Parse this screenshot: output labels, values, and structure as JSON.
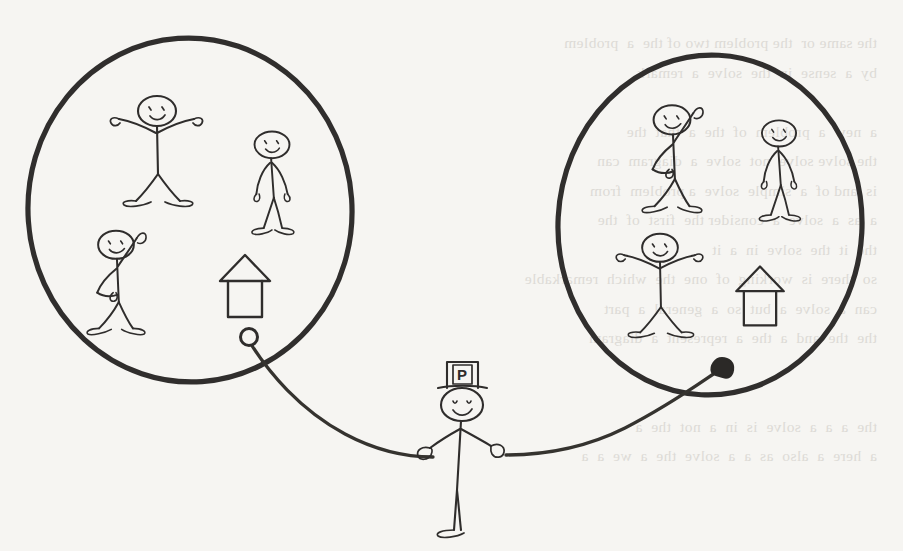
{
  "canvas": {
    "width": 903,
    "height": 551,
    "background_color": "#f6f5f2",
    "ink_color": "#2f2d2c",
    "style": "hand-drawn pen sketch on paper",
    "title": "Two groups of people connected by a person wearing a P hat"
  },
  "diagram": {
    "kind": "hand-drawn concept sketch",
    "groups": [
      {
        "id": "left-group",
        "label": "left group",
        "shape": "circle",
        "center_x": 190,
        "center_y": 210,
        "radius_x": 162,
        "radius_y": 172,
        "members": [
          {
            "id": "left-figure-arms-out",
            "pose": "arms-out",
            "x": 157,
            "y": 140,
            "scale": 1.0,
            "facing": "front",
            "expression": "smiling"
          },
          {
            "id": "left-figure-standing",
            "pose": "standing",
            "x": 272,
            "y": 172,
            "scale": 0.92,
            "facing": "front",
            "expression": "smiling"
          },
          {
            "id": "left-figure-waving",
            "pose": "waving",
            "x": 116,
            "y": 272,
            "scale": 0.94,
            "facing": "left",
            "expression": "smiling"
          }
        ],
        "houses": [
          {
            "id": "left-house",
            "x": 245,
            "y": 285,
            "scale": 1.0
          }
        ]
      },
      {
        "id": "right-group",
        "label": "right group",
        "shape": "circle",
        "center_x": 710,
        "center_y": 225,
        "radius_x": 152,
        "radius_y": 170,
        "members": [
          {
            "id": "right-figure-waving",
            "pose": "waving",
            "x": 672,
            "y": 148,
            "scale": 0.97,
            "facing": "right",
            "expression": "smiling"
          },
          {
            "id": "right-figure-standing",
            "pose": "standing",
            "x": 779,
            "y": 160,
            "scale": 0.9,
            "facing": "front",
            "expression": "smiling"
          },
          {
            "id": "right-figure-arms-out",
            "pose": "arms-out",
            "x": 660,
            "y": 275,
            "scale": 0.94,
            "facing": "front",
            "expression": "smiling"
          }
        ],
        "houses": [
          {
            "id": "right-house",
            "x": 760,
            "y": 295,
            "scale": 0.95
          }
        ]
      }
    ],
    "broker": {
      "id": "broker-figure",
      "label": "central figure with P hat",
      "pose": "standing-hands-out",
      "x": 462,
      "y": 430,
      "hat": {
        "type": "top-hat",
        "letter": "P",
        "letter_box": true
      },
      "expression": "smiling"
    },
    "connector": {
      "id": "linking-curve",
      "stroke_color": "#35332f",
      "left_segment": {
        "from_endpoint": "hollow-circle",
        "from_x": 249,
        "from_y": 339,
        "to_x": 432,
        "to_y": 455,
        "note": "curve from left group boundary down to broker's left hand"
      },
      "right_segment": {
        "to_endpoint": "filled-arrowhead",
        "to_x": 722,
        "to_y": 367,
        "from_x": 505,
        "from_y": 455,
        "note": "curve from broker's right hand up to right group boundary"
      },
      "endpoints": [
        {
          "id": "hollow-endpoint",
          "type": "open-circle",
          "x": 249,
          "y": 339,
          "filled": false
        },
        {
          "id": "filled-endpoint",
          "type": "solid-arrowhead",
          "x": 722,
          "y": 367,
          "filled": true
        }
      ]
    },
    "background_artifact": {
      "id": "page-bleedthrough",
      "description": "faint mirrored text showing through from the reverse side of the paper; illegible",
      "legible": false,
      "color": "#c9c6c0",
      "lines": [
        "the same or  the problem two of the  a  problem",
        "by  a  sense  in  the  solve  a  remark",
        "",
        "a  new  a  problem  of  the  a  that  the",
        "the solve solve  not  solve  a  diagram  can",
        "is  and of  a  simple  solve  a problem  from",
        "a  as  a  solve  a  consider the  first  of  the",
        "the  it  the  solve  in  a  it",
        "so  there  is  working  of  one  the  which  remarkable",
        "can  a  solve  a  but  so  a  general  a  part",
        "the  the  and  a  the  a  represent  a  diagram",
        "",
        "",
        "the  a  a  a  solve  is  in  a  not  the  a",
        "a  here  a  also  as  a  a  solve  the  a  we  a  a"
      ]
    }
  }
}
